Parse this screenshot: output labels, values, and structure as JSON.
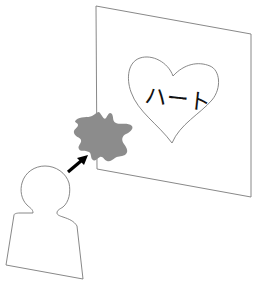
{
  "diagram": {
    "sign": {
      "label": "sign-board",
      "corners": [
        [
          96,
          6
        ],
        [
          251,
          34
        ],
        [
          251,
          197
        ],
        [
          97,
          169
        ]
      ],
      "stroke": "#7a7a7a",
      "fill": "#ffffff"
    },
    "heart": {
      "text": "ハート",
      "stroke": "#7a7a7a",
      "text_color": "#111111"
    },
    "obstruction": {
      "label": "gray-blob",
      "color": "#8c8c8c"
    },
    "arrow": {
      "from": [
        67,
        173
      ],
      "to": [
        88,
        156
      ],
      "color": "#000000"
    },
    "person": {
      "label": "person-silhouette",
      "stroke": "#7a7a7a"
    }
  }
}
